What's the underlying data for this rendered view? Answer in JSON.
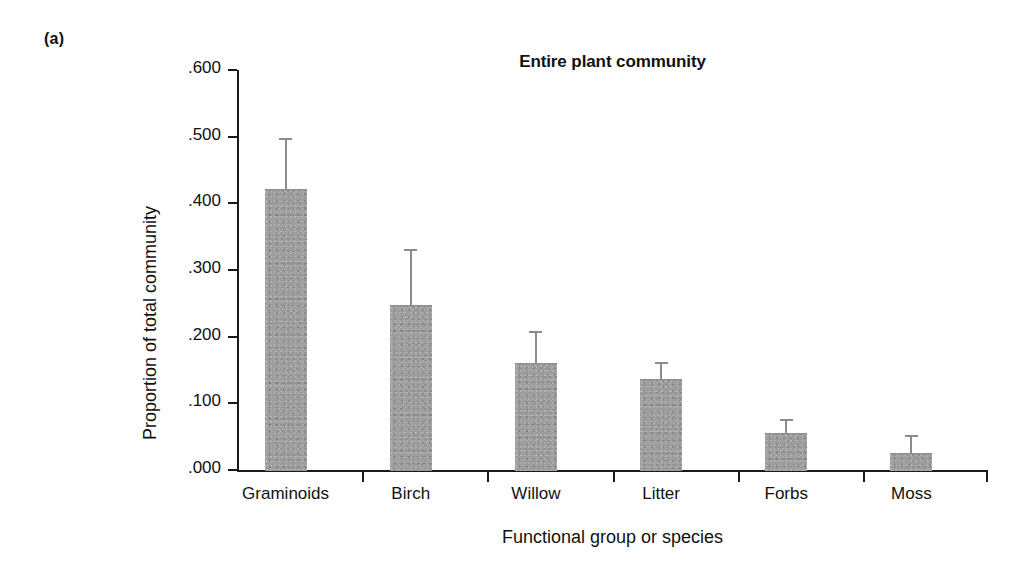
{
  "panel": {
    "label": "(a)"
  },
  "chart_data": {
    "type": "bar",
    "title": "Entire plant community",
    "xlabel": "Functional group or species",
    "ylabel": "Proportion of total community",
    "categories": [
      "Graminoids",
      "Birch",
      "Willow",
      "Litter",
      "Forbs",
      "Moss"
    ],
    "values": [
      0.422,
      0.247,
      0.161,
      0.137,
      0.056,
      0.026
    ],
    "errors_upper": [
      0.498,
      0.331,
      0.209,
      0.162,
      0.076,
      0.052
    ],
    "error_type": "upper-only whisker (standard error)",
    "ylim": [
      0.0,
      0.6
    ],
    "ytick_values": [
      0.6,
      0.5,
      0.4,
      0.3,
      0.2,
      0.1,
      0.0
    ],
    "ytick_labels": [
      ".600",
      ".500",
      ".400",
      ".300",
      ".200",
      ".100",
      ".000"
    ],
    "grid": false,
    "legend": false,
    "bar_color": "#9d9d9d",
    "axis_color": "#1a1a1a",
    "error_color": "#8c8c8c"
  }
}
